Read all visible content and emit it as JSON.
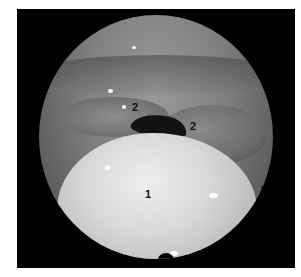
{
  "image": {
    "description": "Circular endoscopic laryngoscopy view with numbered anatomical labels",
    "labels": [
      {
        "id": "label-1",
        "text": "1"
      },
      {
        "id": "label-2a",
        "text": "2"
      },
      {
        "id": "label-2b",
        "text": "2"
      }
    ],
    "colors": {
      "border": "#000000",
      "tissue_light": "#eeeeee",
      "tissue_mid": "#7d7d7d",
      "airway_dark": "#121212"
    }
  }
}
